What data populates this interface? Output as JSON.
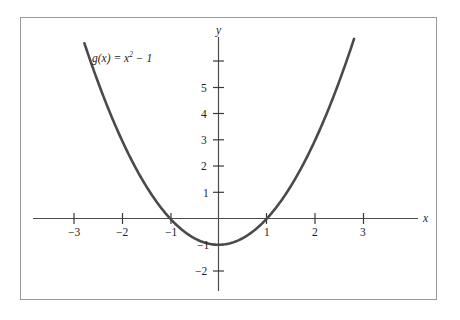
{
  "figure": {
    "kind": "cartesian-graph",
    "background_color": "#ffffff",
    "frame_border_color": "#9a9a9a",
    "axis_color": "#4d4d4d",
    "curve_color": "#4a4a4a",
    "text_color": "#1d1d1d"
  },
  "axes": {
    "x_axis_name": "x",
    "y_axis_name": "y",
    "x_tick_labels": [
      "−3",
      "−2",
      "−1",
      "1",
      "2",
      "3"
    ],
    "y_tick_labels": [
      "5",
      "4",
      "3",
      "2",
      "1",
      "−1",
      "−2"
    ]
  },
  "curve": {
    "label_g": "g",
    "label_paren_open": "(",
    "label_var": "x",
    "label_paren_close": ")",
    "label_equals": " = ",
    "label_x": "x",
    "label_exponent": "2",
    "label_minus_one": " − 1",
    "label_full": "g(x) = x² − 1"
  },
  "chart_data": {
    "type": "line",
    "title": "",
    "subtitle": "",
    "xlabel": "x",
    "ylabel": "y",
    "legend": [
      "g(x) = x² − 1"
    ],
    "legend_position": "upper-left-inline",
    "grid": false,
    "equation": "g(x) = x^2 - 1",
    "xlim": [
      -3.8,
      4.1
    ],
    "ylim": [
      -2.6,
      6.9
    ],
    "xticks": [
      -3,
      -2,
      -1,
      1,
      2,
      3
    ],
    "yticks": [
      5,
      4,
      3,
      2,
      1,
      -1,
      -2
    ],
    "xtick_labels": [
      "−3",
      "−2",
      "−1",
      "1",
      "2",
      "3"
    ],
    "ytick_labels": [
      "5",
      "4",
      "3",
      "2",
      "1",
      "−1",
      "−2"
    ],
    "unticked_y_gridmarks": [
      6
    ],
    "series": [
      {
        "name": "g(x) = x² − 1",
        "color": "#4a4a4a",
        "x": [
          -2.77,
          -2.6,
          -2.4,
          -2.2,
          -2.0,
          -1.8,
          -1.6,
          -1.4,
          -1.2,
          -1.0,
          -0.8,
          -0.6,
          -0.4,
          -0.2,
          0.0,
          0.2,
          0.4,
          0.6,
          0.8,
          1.0,
          1.2,
          1.4,
          1.6,
          1.8,
          2.0,
          2.2,
          2.4,
          2.6,
          2.8
        ],
        "y": [
          6.67,
          5.76,
          4.76,
          3.84,
          3.0,
          2.24,
          1.56,
          0.96,
          0.44,
          0.0,
          -0.36,
          -0.64,
          -0.84,
          -0.96,
          -1.0,
          -0.96,
          -0.84,
          -0.64,
          -0.36,
          0.0,
          0.44,
          0.96,
          1.56,
          2.24,
          3.0,
          3.84,
          4.76,
          5.76,
          6.84
        ]
      }
    ],
    "annotations": [
      {
        "text": "g(x) = x² − 1",
        "x": -2.2,
        "y": 6.1
      }
    ],
    "roots": [
      -1,
      1
    ],
    "vertex": [
      0,
      -1
    ]
  }
}
